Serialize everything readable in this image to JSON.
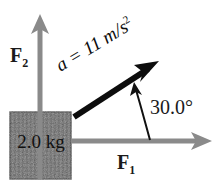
{
  "figure": {
    "type": "free-body-force-diagram",
    "background_color": "#ffffff",
    "block": {
      "label": "2.0 kg",
      "fill_color": "#6b6b6b",
      "border_color": "#3a3a3a",
      "x": 10,
      "y": 112,
      "width": 61,
      "height": 67
    },
    "vectors": [
      {
        "name": "F2",
        "label": "F",
        "subscript": "2",
        "color": "#8a8a8a",
        "direction": "up",
        "from": [
          40,
          179
        ],
        "to": [
          40,
          15
        ]
      },
      {
        "name": "F1",
        "label": "F",
        "subscript": "1",
        "color": "#8a8a8a",
        "direction": "right",
        "from": [
          71,
          141
        ],
        "to": [
          211,
          141
        ]
      },
      {
        "name": "acceleration",
        "label": "a = 11 m/s",
        "superscript": "2",
        "label_full": "a = 11 m/s²",
        "value": 11,
        "units": "m/s^2",
        "color": "#0d0d0d",
        "direction": "up-right",
        "angle_deg": 30.0,
        "from": [
          74,
          117
        ],
        "to": [
          158,
          62
        ]
      }
    ],
    "angle_annotation": {
      "label": "30.0°",
      "value": 30.0,
      "units": "degrees",
      "color": "#111111",
      "arc_from": [
        150,
        140
      ],
      "arc_to": [
        135,
        84
      ]
    }
  }
}
